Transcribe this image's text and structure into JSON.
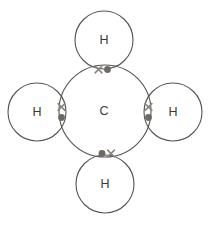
{
  "figure": {
    "name": "methane-dot-and-cross-diagram",
    "molecule": "CH4",
    "background_color": "#ffffff",
    "stroke_color": "#555555",
    "dot_color": "#6e6a63",
    "cross_color": "#8a847c",
    "label_color": "#3b3b3b",
    "width": 211,
    "height": 225
  },
  "atoms": {
    "central": {
      "label": "C",
      "element_name": "carbon",
      "cx": 105,
      "cy": 111,
      "r": 46,
      "label_x": 104,
      "label_y": 112
    },
    "outer": [
      {
        "label": "H",
        "element_name": "hydrogen",
        "position": "top",
        "cx": 104,
        "cy": 40,
        "r": 29,
        "label_x": 104,
        "label_y": 41
      },
      {
        "label": "H",
        "element_name": "hydrogen",
        "position": "left",
        "cx": 37,
        "cy": 112,
        "r": 29,
        "label_x": 37,
        "label_y": 113
      },
      {
        "label": "H",
        "element_name": "hydrogen",
        "position": "right",
        "cx": 173,
        "cy": 112,
        "r": 29,
        "label_x": 173,
        "label_y": 113
      },
      {
        "label": "H",
        "element_name": "hydrogen",
        "position": "bottom",
        "cx": 105,
        "cy": 184,
        "r": 29,
        "label_x": 105,
        "label_y": 185
      }
    ]
  },
  "bonding_pairs": [
    {
      "bond_name": "bond-top",
      "orientation": "horizontal",
      "cross": {
        "x": 98.5,
        "y": 69.5,
        "size": 3.4
      },
      "dot": {
        "x": 107.5,
        "y": 69.5,
        "r": 3.4
      }
    },
    {
      "bond_name": "bond-left",
      "orientation": "vertical",
      "cross": {
        "x": 61.5,
        "y": 107.0,
        "size": 3.4
      },
      "dot": {
        "x": 61.5,
        "y": 117.5,
        "r": 3.4
      }
    },
    {
      "bond_name": "bond-right",
      "orientation": "vertical",
      "cross": {
        "x": 148.5,
        "y": 107.0,
        "size": 3.4
      },
      "dot": {
        "x": 148.5,
        "y": 117.5,
        "r": 3.4
      }
    },
    {
      "bond_name": "bond-bottom",
      "orientation": "horizontal",
      "dot": {
        "x": 102.0,
        "y": 153.5,
        "r": 3.4
      },
      "cross": {
        "x": 111.0,
        "y": 153.5,
        "size": 3.4
      }
    }
  ]
}
